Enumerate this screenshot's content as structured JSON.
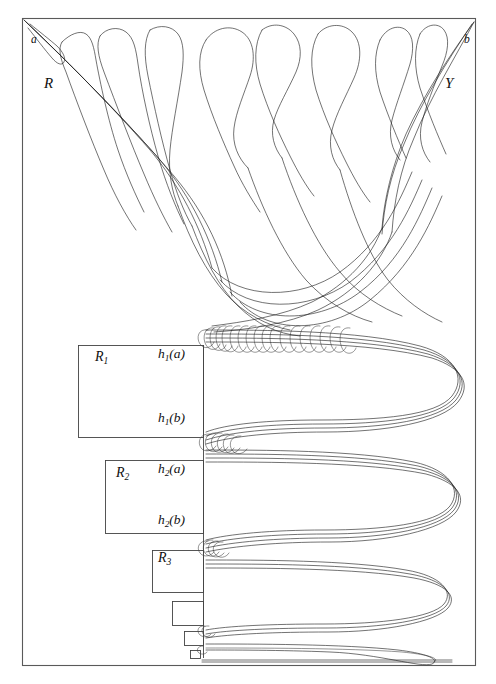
{
  "figure": {
    "type": "mathematical-diagram",
    "frame": {
      "x": 22,
      "y": 18,
      "width": 454,
      "height": 648
    },
    "corner_labels": [
      {
        "name": "corner-label-a",
        "text": "a",
        "x": 31,
        "y": 40
      },
      {
        "name": "corner-label-b",
        "text": "b",
        "x": 464,
        "y": 40
      }
    ],
    "region_labels": [
      {
        "name": "region-label-R",
        "text": "R",
        "x": 44,
        "y": 80
      },
      {
        "name": "region-label-Y",
        "text": "Y",
        "x": 445,
        "y": 80
      }
    ],
    "partition_rects": [
      {
        "name": "partition-rect-R1",
        "label": "R",
        "sub": "1",
        "x": 78,
        "y": 345,
        "width": 125,
        "height": 92,
        "label_x": 95,
        "label_y": 353
      },
      {
        "name": "partition-rect-R2",
        "label": "R",
        "sub": "2",
        "x": 105,
        "y": 460,
        "width": 98,
        "height": 73,
        "label_x": 116,
        "label_y": 468
      },
      {
        "name": "partition-rect-R3",
        "label": "R",
        "sub": "3",
        "x": 152,
        "y": 550,
        "width": 51,
        "height": 42,
        "label_x": 158,
        "label_y": 551
      },
      {
        "name": "partition-rect-R4",
        "label": "",
        "sub": "",
        "x": 172,
        "y": 601,
        "width": 31,
        "height": 24,
        "label_x": 0,
        "label_y": 0
      },
      {
        "name": "partition-rect-R5",
        "label": "",
        "sub": "",
        "x": 184,
        "y": 631,
        "width": 19,
        "height": 14,
        "label_x": 0,
        "label_y": 0
      },
      {
        "name": "partition-rect-R6",
        "label": "",
        "sub": "",
        "x": 190,
        "y": 650,
        "width": 10,
        "height": 8,
        "label_x": 0,
        "label_y": 0
      }
    ],
    "h_labels": [
      {
        "name": "h-label-h1a",
        "h": "h",
        "sub": "1",
        "arg": "(a)",
        "x": 160,
        "y": 348
      },
      {
        "name": "h-label-h1b",
        "h": "h",
        "sub": "1",
        "arg": "(b)",
        "x": 160,
        "y": 412
      },
      {
        "name": "h-label-h2a",
        "h": "h",
        "sub": "2",
        "arg": "(a)",
        "x": 160,
        "y": 463
      },
      {
        "name": "h-label-h2b",
        "h": "h",
        "sub": "2",
        "arg": "(b)",
        "x": 160,
        "y": 514
      }
    ],
    "divider": {
      "name": "partition-divider-line",
      "x": 203,
      "y1": 345,
      "y2": 658
    },
    "colors": {
      "frame_stroke": "#5a5a5a",
      "curve_stroke": "#1c1c1c",
      "rect_stroke": "#444444",
      "background": "#ffffff"
    }
  }
}
